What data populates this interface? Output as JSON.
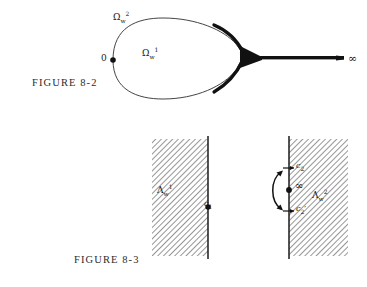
{
  "page": {
    "background": "#ffffff",
    "ink": "#141414",
    "width": 367,
    "height": 287
  },
  "figures": [
    {
      "id": "figure-8-2",
      "caption": "FIGURE 8-2",
      "description": "Teardrop contour from 0 pinching into a slit going to infinity",
      "labels": {
        "outer_region": {
          "base": "Ω",
          "sub": "w",
          "sup": "2"
        },
        "inner_region": {
          "base": "Ω",
          "sub": "w",
          "sup": "1"
        },
        "origin": "0",
        "infinity": "∞"
      }
    },
    {
      "id": "figure-8-3",
      "caption": "FIGURE 8-3",
      "description": "Two hatched half-plane panels with marked boundary points",
      "panels": [
        {
          "id": "panel-left",
          "region_label": {
            "base": "Λ",
            "sub": "w",
            "sup": "1"
          },
          "points": [
            {
              "name": "c1",
              "base": "c",
              "sub": "1",
              "marker": "dot"
            }
          ],
          "hatch_side": "left",
          "arrow": false
        },
        {
          "id": "panel-right",
          "region_label": {
            "base": "Λ",
            "sub": "w",
            "sup": "2"
          },
          "points": [
            {
              "name": "c2",
              "base": "c",
              "sub": "2",
              "marker": "tick"
            },
            {
              "name": "infinity",
              "base": "∞",
              "sub": "",
              "marker": "dot"
            },
            {
              "name": "c2prime",
              "base": "c",
              "sub": "2",
              "prime": "′",
              "marker": "tick"
            }
          ],
          "hatch_side": "right",
          "arrow": true,
          "arrow_description": "double-headed curved arrow spanning c2 to c2-prime"
        }
      ]
    }
  ],
  "colors": {
    "ink": "#141414",
    "curve": "#2a2a2a",
    "hatch": "#555555",
    "caption": "#2b2b2b",
    "slit_fill": "#111111"
  }
}
